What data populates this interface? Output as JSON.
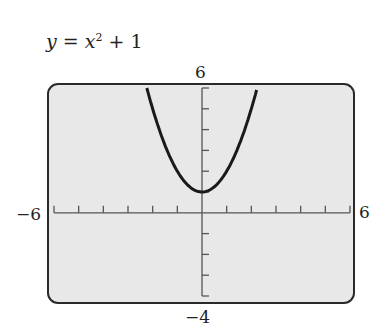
{
  "equation": {
    "y": "y",
    "eq": " = ",
    "x": "x",
    "exp": "2",
    "rest": " + 1"
  },
  "window": {
    "xmin": "−6",
    "xmax": "6",
    "ymin": "−4",
    "ymax": "6"
  },
  "colors": {
    "screen": "#e8e8e8",
    "frame": "#2a2a2a",
    "curve": "#1a1a1a",
    "axis": "#555555"
  },
  "chart_data": {
    "type": "line",
    "xlabel": "",
    "ylabel": "",
    "xlim": [
      -6,
      6
    ],
    "ylim": [
      -4,
      6
    ],
    "xticks_step": 1,
    "yticks_step": 1,
    "grid": false,
    "series": [
      {
        "name": "y = x^2 + 1",
        "x": [
          -2.24,
          -2,
          -1.5,
          -1,
          -0.5,
          0,
          0.5,
          1,
          1.5,
          2,
          2.24
        ],
        "y": [
          6,
          5,
          3.25,
          2,
          1.25,
          1,
          1.25,
          2,
          3.25,
          5,
          6
        ]
      }
    ]
  }
}
